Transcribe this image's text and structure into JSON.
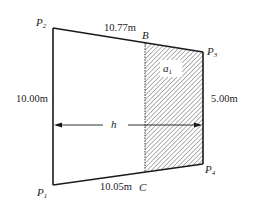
{
  "diagram": {
    "type": "trapezoid-area-partition",
    "colors": {
      "stroke": "#1a1a1a",
      "hatch": "#555555",
      "background": "#ffffff"
    },
    "points": {
      "P1": {
        "label": "P",
        "sub": "1"
      },
      "P2": {
        "label": "P",
        "sub": "2"
      },
      "P3": {
        "label": "P",
        "sub": "3"
      },
      "P4": {
        "label": "P",
        "sub": "4"
      },
      "B": {
        "label": "B"
      },
      "C": {
        "label": "C"
      }
    },
    "dimensions": {
      "top_edge": "10.77m",
      "bottom_edge": "10.05m",
      "left_edge": "10.00m",
      "right_edge": "5.00m"
    },
    "region": {
      "label": "a",
      "sub": "1",
      "fill": "hatched"
    },
    "distance": {
      "label": "h"
    }
  }
}
